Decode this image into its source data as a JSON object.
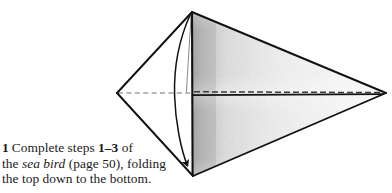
{
  "figure": {
    "name": "origami-fold-diagram",
    "colors": {
      "ink": "#111111",
      "paper": "#ffffff",
      "shading": "#c9c9c9",
      "dashed_line": "#6f6f6f"
    },
    "geometry": {
      "apex_top": [
        192,
        12
      ],
      "vertex_left": [
        117,
        93
      ],
      "vertex_right": [
        386,
        93
      ],
      "apex_bottom": [
        193,
        176
      ],
      "spine_x": 192,
      "axis_y": 93
    },
    "elements": [
      {
        "name": "left-upper-edge",
        "type": "solid-fold-edge"
      },
      {
        "name": "left-lower-edge",
        "type": "solid-fold-edge"
      },
      {
        "name": "right-upper-edge",
        "type": "solid-fold-edge"
      },
      {
        "name": "right-lower-edge",
        "type": "solid-fold-edge"
      },
      {
        "name": "vertical-spine",
        "type": "solid-fold-edge"
      },
      {
        "name": "horizontal-axis",
        "type": "dashed-valley-fold"
      },
      {
        "name": "shaded-right-panel",
        "type": "shading"
      },
      {
        "name": "curved-fold-arrow",
        "type": "arrow"
      }
    ]
  },
  "caption": {
    "step_number": "1",
    "line1_part1": "Complete steps ",
    "line1_range": "1–3",
    "line1_part2": " of",
    "line2_part1": "the ",
    "line2_italic": "sea bird",
    "line2_part2": " (page 50), folding",
    "line3": "the top down to the bottom."
  }
}
